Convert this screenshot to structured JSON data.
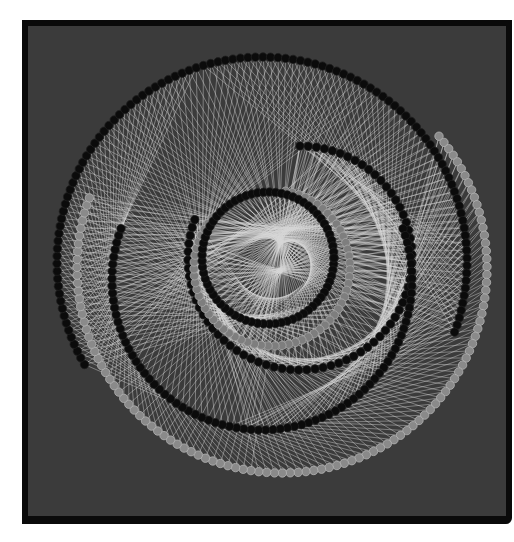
{
  "figure": {
    "type": "network-graph",
    "background": "#3b3b3b",
    "frame_color": "#0a0a0a",
    "edge_color": "#d8d8d8",
    "edge_opacity": 0.55,
    "node_radius": 4.2,
    "rings": [
      {
        "name": "outer-black-ring",
        "cx": 262,
        "cy": 262,
        "r": 205,
        "count": 110,
        "start_deg": 150,
        "end_deg": 380,
        "fill": "#0b0b0b",
        "stroke": "#1e1e1e"
      },
      {
        "name": "outer-gray-ring",
        "cx": 282,
        "cy": 268,
        "r": 205,
        "count": 110,
        "start_deg": -40,
        "end_deg": 200,
        "fill": "#8a8a8a",
        "stroke": "#b5b5b5"
      },
      {
        "name": "middle-black-ring",
        "cx": 300,
        "cy": 258,
        "r": 112,
        "count": 70,
        "start_deg": -90,
        "end_deg": 200,
        "fill": "#0b0b0b",
        "stroke": "#1e1e1e"
      },
      {
        "name": "lower-black-arc",
        "cx": 262,
        "cy": 280,
        "r": 150,
        "count": 80,
        "start_deg": -20,
        "end_deg": 200,
        "fill": "#0b0b0b",
        "stroke": "#1e1e1e"
      },
      {
        "name": "inner-gray-ring",
        "cx": 272,
        "cy": 268,
        "r": 78,
        "count": 60,
        "start_deg": -80,
        "end_deg": 220,
        "fill": "#7e7e7e",
        "stroke": "#a8a8a8"
      },
      {
        "name": "inner-black-ring",
        "cx": 268,
        "cy": 258,
        "r": 66,
        "count": 70,
        "start_deg": 0,
        "end_deg": 360,
        "fill": "#0b0b0b",
        "stroke": "#1e1e1e"
      }
    ],
    "edge_sets": [
      {
        "from": "outer-black-ring",
        "to": "middle-black-ring",
        "offset": 8
      },
      {
        "from": "outer-black-ring",
        "to": "inner-gray-ring",
        "offset": 20
      },
      {
        "from": "outer-gray-ring",
        "to": "lower-black-arc",
        "offset": 4
      },
      {
        "from": "outer-gray-ring",
        "to": "middle-black-ring",
        "offset": 30
      },
      {
        "from": "lower-black-arc",
        "to": "inner-gray-ring",
        "offset": 12
      },
      {
        "from": "middle-black-ring",
        "to": "inner-black-ring",
        "offset": 18
      },
      {
        "from": "outer-black-ring",
        "to": "lower-black-arc",
        "offset": 45
      }
    ]
  }
}
